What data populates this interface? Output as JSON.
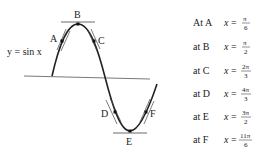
{
  "diagram": {
    "curve_label": "y = sin x",
    "points": [
      {
        "name": "A",
        "x_value": "π/6"
      },
      {
        "name": "B",
        "x_value": "π/2"
      },
      {
        "name": "C",
        "x_value": "2π/3"
      },
      {
        "name": "D",
        "x_value": "4π/3"
      },
      {
        "name": "E",
        "x_value": "3π/2"
      },
      {
        "name": "F",
        "x_value": "11π/6"
      }
    ],
    "legend": [
      {
        "prefix": "At A",
        "var": "x",
        "num": "π",
        "den": "6"
      },
      {
        "prefix": "at B",
        "var": "x",
        "num": "π",
        "den": "2"
      },
      {
        "prefix": "at C",
        "var": "x",
        "num": "2π",
        "den": "3"
      },
      {
        "prefix": "at D",
        "var": "x",
        "num": "4π",
        "den": "3"
      },
      {
        "prefix": "at E",
        "var": "x",
        "num": "3π",
        "den": "2"
      },
      {
        "prefix": "at F",
        "var": "x",
        "num": "11π",
        "den": "6"
      }
    ],
    "labels": {
      "A": "A",
      "B": "B",
      "C": "C",
      "D": "D",
      "E": "E",
      "F": "F"
    },
    "colors": {
      "stroke": "#222222",
      "axis": "#555555"
    }
  }
}
